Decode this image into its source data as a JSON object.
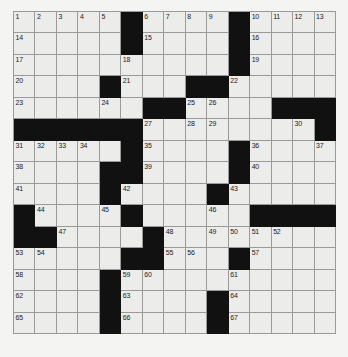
{
  "puzzle": {
    "title": "Crossword Grid",
    "rows": 15,
    "columns": 15,
    "colors": {
      "page_background": "#f3f3f1",
      "cell_background": "#ececeb",
      "block_background": "#111111",
      "grid_line": "#9a9a9a",
      "number_text": "#1b1b1b"
    },
    "legend": {
      "open_cell": "white-cell",
      "blocked_cell": "black-cell"
    },
    "grid": [
      [
        "o",
        "o",
        "o",
        "o",
        "o",
        "b",
        "o",
        "o",
        "o",
        "o",
        "b",
        "o",
        "o",
        "o",
        "o"
      ],
      [
        "o",
        "o",
        "o",
        "o",
        "o",
        "b",
        "o",
        "o",
        "o",
        "o",
        "b",
        "o",
        "o",
        "o",
        "o"
      ],
      [
        "o",
        "o",
        "o",
        "o",
        "o",
        "o",
        "o",
        "o",
        "o",
        "o",
        "b",
        "o",
        "o",
        "o",
        "o"
      ],
      [
        "o",
        "o",
        "o",
        "o",
        "b",
        "o",
        "o",
        "o",
        "b",
        "b",
        "o",
        "o",
        "o",
        "o",
        "o"
      ],
      [
        "o",
        "o",
        "o",
        "o",
        "o",
        "o",
        "b",
        "b",
        "o",
        "o",
        "o",
        "o",
        "b",
        "b",
        "b"
      ],
      [
        "b",
        "b",
        "b",
        "b",
        "b",
        "b",
        "o",
        "o",
        "o",
        "o",
        "o",
        "o",
        "o",
        "o",
        "b"
      ],
      [
        "o",
        "o",
        "o",
        "o",
        "o",
        "b",
        "o",
        "o",
        "o",
        "o",
        "b",
        "o",
        "o",
        "o",
        "o"
      ],
      [
        "o",
        "o",
        "o",
        "o",
        "b",
        "b",
        "o",
        "o",
        "o",
        "o",
        "b",
        "o",
        "o",
        "o",
        "o"
      ],
      [
        "o",
        "o",
        "o",
        "o",
        "b",
        "o",
        "o",
        "o",
        "o",
        "b",
        "o",
        "o",
        "o",
        "o",
        "o"
      ],
      [
        "b",
        "o",
        "o",
        "o",
        "o",
        "b",
        "o",
        "o",
        "o",
        "o",
        "o",
        "b",
        "b",
        "b",
        "b"
      ],
      [
        "b",
        "b",
        "o",
        "o",
        "o",
        "o",
        "b",
        "o",
        "o",
        "o",
        "o",
        "o",
        "o",
        "o",
        "o"
      ],
      [
        "o",
        "o",
        "o",
        "o",
        "o",
        "b",
        "b",
        "o",
        "o",
        "o",
        "b",
        "o",
        "o",
        "o",
        "o"
      ],
      [
        "o",
        "o",
        "o",
        "o",
        "b",
        "o",
        "o",
        "o",
        "o",
        "o",
        "o",
        "o",
        "o",
        "o",
        "o"
      ],
      [
        "o",
        "o",
        "o",
        "o",
        "b",
        "o",
        "o",
        "o",
        "o",
        "b",
        "o",
        "o",
        "o",
        "o",
        "o"
      ],
      [
        "o",
        "o",
        "o",
        "o",
        "b",
        "o",
        "o",
        "o",
        "o",
        "b",
        "o",
        "o",
        "o",
        "o",
        "o"
      ]
    ],
    "numbers": [
      {
        "row": 0,
        "col": 0,
        "n": "1"
      },
      {
        "row": 0,
        "col": 1,
        "n": "2"
      },
      {
        "row": 0,
        "col": 2,
        "n": "3"
      },
      {
        "row": 0,
        "col": 3,
        "n": "4"
      },
      {
        "row": 0,
        "col": 4,
        "n": "5"
      },
      {
        "row": 0,
        "col": 6,
        "n": "6"
      },
      {
        "row": 0,
        "col": 7,
        "n": "7"
      },
      {
        "row": 0,
        "col": 8,
        "n": "8"
      },
      {
        "row": 0,
        "col": 9,
        "n": "9"
      },
      {
        "row": 0,
        "col": 11,
        "n": "10"
      },
      {
        "row": 0,
        "col": 12,
        "n": "11"
      },
      {
        "row": 0,
        "col": 13,
        "n": "12"
      },
      {
        "row": 0,
        "col": 14,
        "n": "13"
      },
      {
        "row": 1,
        "col": 0,
        "n": "14"
      },
      {
        "row": 1,
        "col": 6,
        "n": "15"
      },
      {
        "row": 1,
        "col": 11,
        "n": "16"
      },
      {
        "row": 2,
        "col": 0,
        "n": "17"
      },
      {
        "row": 2,
        "col": 5,
        "n": "18"
      },
      {
        "row": 2,
        "col": 11,
        "n": "19"
      },
      {
        "row": 3,
        "col": 0,
        "n": "20"
      },
      {
        "row": 3,
        "col": 5,
        "n": "21"
      },
      {
        "row": 3,
        "col": 10,
        "n": "22"
      },
      {
        "row": 4,
        "col": 0,
        "n": "23"
      },
      {
        "row": 4,
        "col": 4,
        "n": "24"
      },
      {
        "row": 4,
        "col": 8,
        "n": "25"
      },
      {
        "row": 4,
        "col": 9,
        "n": "26"
      },
      {
        "row": 5,
        "col": 6,
        "n": "27"
      },
      {
        "row": 5,
        "col": 8,
        "n": "28"
      },
      {
        "row": 5,
        "col": 9,
        "n": "29"
      },
      {
        "row": 5,
        "col": 13,
        "n": "30"
      },
      {
        "row": 6,
        "col": 0,
        "n": "31"
      },
      {
        "row": 6,
        "col": 1,
        "n": "32"
      },
      {
        "row": 6,
        "col": 2,
        "n": "33"
      },
      {
        "row": 6,
        "col": 3,
        "n": "34"
      },
      {
        "row": 6,
        "col": 6,
        "n": "35"
      },
      {
        "row": 6,
        "col": 11,
        "n": "36"
      },
      {
        "row": 6,
        "col": 14,
        "n": "37"
      },
      {
        "row": 7,
        "col": 0,
        "n": "38"
      },
      {
        "row": 7,
        "col": 6,
        "n": "39"
      },
      {
        "row": 7,
        "col": 11,
        "n": "40"
      },
      {
        "row": 8,
        "col": 0,
        "n": "41"
      },
      {
        "row": 8,
        "col": 5,
        "n": "42"
      },
      {
        "row": 8,
        "col": 10,
        "n": "43"
      },
      {
        "row": 9,
        "col": 1,
        "n": "44"
      },
      {
        "row": 9,
        "col": 4,
        "n": "45"
      },
      {
        "row": 9,
        "col": 9,
        "n": "46"
      },
      {
        "row": 10,
        "col": 2,
        "n": "47"
      },
      {
        "row": 10,
        "col": 7,
        "n": "48"
      },
      {
        "row": 10,
        "col": 9,
        "n": "49"
      },
      {
        "row": 10,
        "col": 10,
        "n": "50"
      },
      {
        "row": 10,
        "col": 11,
        "n": "51"
      },
      {
        "row": 10,
        "col": 12,
        "n": "52"
      },
      {
        "row": 11,
        "col": 0,
        "n": "53"
      },
      {
        "row": 11,
        "col": 1,
        "n": "54"
      },
      {
        "row": 11,
        "col": 7,
        "n": "55"
      },
      {
        "row": 11,
        "col": 8,
        "n": "56"
      },
      {
        "row": 11,
        "col": 11,
        "n": "57"
      },
      {
        "row": 12,
        "col": 0,
        "n": "58"
      },
      {
        "row": 12,
        "col": 5,
        "n": "59"
      },
      {
        "row": 12,
        "col": 6,
        "n": "60"
      },
      {
        "row": 12,
        "col": 10,
        "n": "61"
      },
      {
        "row": 13,
        "col": 0,
        "n": "62"
      },
      {
        "row": 13,
        "col": 5,
        "n": "63"
      },
      {
        "row": 13,
        "col": 10,
        "n": "64"
      },
      {
        "row": 14,
        "col": 0,
        "n": "65"
      },
      {
        "row": 14,
        "col": 5,
        "n": "66"
      },
      {
        "row": 14,
        "col": 10,
        "n": "67"
      }
    ],
    "entries": []
  }
}
